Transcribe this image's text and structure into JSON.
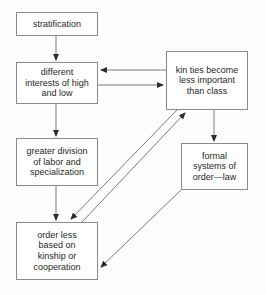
{
  "diagram": {
    "background_color": "#fdfdfd",
    "node_border_color": "#8a8a8a",
    "edge_color": "#6f6f6f",
    "text_color": "#1f1f1f",
    "nodes": [
      {
        "id": "stratification",
        "label": "stratification"
      },
      {
        "id": "different",
        "label": "different\ninterests of high\nand low"
      },
      {
        "id": "greater",
        "label": "greater division\nof labor and\nspecialization"
      },
      {
        "id": "orderless",
        "label": "order less\nbased on\nkinship or\ncooperation"
      },
      {
        "id": "kinties",
        "label": "kin ties become\nless important\nthan class"
      },
      {
        "id": "formal",
        "label": "formal\nsystems of\norder—law"
      }
    ],
    "edges": [
      {
        "id": "stratification-to-different",
        "from": "stratification",
        "to": "different",
        "style": "vertical-arrow"
      },
      {
        "id": "different-to-greater",
        "from": "different",
        "to": "greater",
        "style": "vertical-arrow"
      },
      {
        "id": "greater-to-orderless",
        "from": "greater",
        "to": "orderless",
        "style": "vertical-arrow"
      },
      {
        "id": "kinties-to-different",
        "from": "kinties",
        "to": "different",
        "style": "horizontal-arrow-left"
      },
      {
        "id": "different-to-kinties",
        "from": "different",
        "to": "kinties",
        "style": "horizontal-arrow-right"
      },
      {
        "id": "kinties-to-formal",
        "from": "kinties",
        "to": "formal",
        "style": "vertical-arrow"
      },
      {
        "id": "orderless-to-kinties",
        "from": "orderless",
        "to": "kinties",
        "style": "diagonal-arrow-up-right"
      },
      {
        "id": "kinties-to-orderless",
        "from": "kinties",
        "to": "orderless",
        "style": "diagonal-arrow-down-left"
      },
      {
        "id": "formal-to-orderless",
        "from": "formal",
        "to": "orderless",
        "style": "diagonal-arrow-down-left"
      }
    ]
  }
}
